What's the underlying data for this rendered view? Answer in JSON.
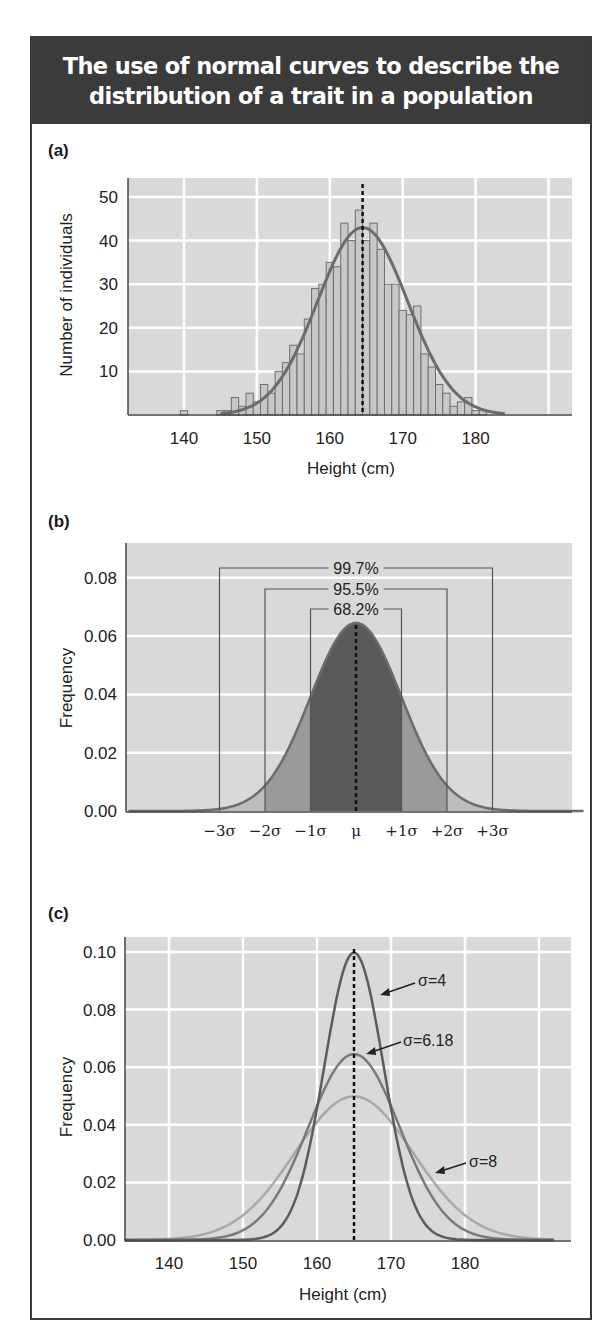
{
  "title": {
    "line1": "The use of normal curves to describe the",
    "line2": "distribution of a trait in a population"
  },
  "colors": {
    "title_bg": "#3b3b3b",
    "plot_bg": "#d9d9d9",
    "grid": "#ffffff",
    "curve": "#6b6b6b",
    "bar_fill": "#c8c8c8",
    "bar_edge": "#6e6e6e",
    "band_1sigma": "#5a5a5a",
    "band_2sigma": "#9a9a9a",
    "band_3sigma": "#bdbdbd",
    "sigma4": "#5c5c5c",
    "sigma618": "#7a7a7a",
    "sigma8": "#a8a8a8"
  },
  "chart_data": [
    {
      "panel": "(a)",
      "type": "bar",
      "title": "",
      "xlabel": "Height (cm)",
      "ylabel": "Number of individuals",
      "xlim": [
        132.5,
        193
      ],
      "ylim": [
        0,
        54
      ],
      "xticks": [
        140,
        150,
        160,
        170,
        180
      ],
      "yticks": [
        10,
        20,
        30,
        40,
        50
      ],
      "grid": true,
      "bin_width_cm": 1,
      "categories": [
        140,
        145,
        146,
        147,
        148,
        149,
        150,
        151,
        152,
        153,
        154,
        155,
        156,
        157,
        158,
        159,
        160,
        161,
        162,
        163,
        164,
        165,
        166,
        167,
        168,
        169,
        170,
        171,
        172,
        173,
        174,
        175,
        176,
        177,
        178,
        179,
        180,
        181
      ],
      "values": [
        1,
        1,
        1,
        4,
        2,
        5,
        3,
        7,
        5,
        10,
        12,
        16,
        14,
        22,
        29,
        30,
        35,
        34,
        44,
        40,
        47,
        40,
        44,
        38,
        30,
        30,
        24,
        23,
        25,
        14,
        11,
        7,
        5,
        2,
        3,
        4,
        1,
        1
      ],
      "fitted_normal": {
        "mean": 164.5,
        "sd": 6.18,
        "peak": 43
      },
      "mean_line": 164.5
    },
    {
      "panel": "(b)",
      "type": "area",
      "title": "",
      "xlabel": "",
      "ylabel": "Frequency",
      "ylim": [
        0,
        0.092
      ],
      "yticks": [
        "0.00",
        "0.02",
        "0.04",
        "0.06",
        "0.08"
      ],
      "grid": true,
      "xtick_labels": [
        "−3σ",
        "−2σ",
        "−1σ",
        "μ",
        "+1σ",
        "+2σ",
        "+3σ"
      ],
      "curve": {
        "mean": 0,
        "sd": 1,
        "peak_frequency": 0.0645
      },
      "annotations": [
        {
          "label": "68.2%",
          "range": [
            "−1σ",
            "+1σ"
          ]
        },
        {
          "label": "95.5%",
          "range": [
            "−2σ",
            "+2σ"
          ]
        },
        {
          "label": "99.7%",
          "range": [
            "−3σ",
            "+3σ"
          ]
        }
      ]
    },
    {
      "panel": "(c)",
      "type": "line",
      "title": "",
      "xlabel": "Height (cm)",
      "ylabel": "Frequency",
      "xlim": [
        134,
        192
      ],
      "ylim": [
        0,
        0.105
      ],
      "xticks": [
        140,
        150,
        160,
        170,
        180
      ],
      "yticks": [
        "0.00",
        "0.02",
        "0.04",
        "0.06",
        "0.08",
        "0.10"
      ],
      "grid": true,
      "mean_line": 165,
      "series": [
        {
          "name": "σ=4",
          "mean": 165,
          "sd": 4,
          "peak": 0.0997
        },
        {
          "name": "σ=6.18",
          "mean": 165,
          "sd": 6.18,
          "peak": 0.0646
        },
        {
          "name": "σ=8",
          "mean": 165,
          "sd": 8,
          "peak": 0.0499
        }
      ]
    }
  ],
  "panels": {
    "a": {
      "label": "(a)",
      "ylabel": "Number of individuals",
      "xlabel": "Height (cm)",
      "xticks": [
        "140",
        "150",
        "160",
        "170",
        "180"
      ],
      "yticks": [
        "10",
        "20",
        "30",
        "40",
        "50"
      ]
    },
    "b": {
      "label": "(b)",
      "ylabel": "Frequency",
      "yticks": [
        "0.00",
        "0.02",
        "0.04",
        "0.06",
        "0.08"
      ],
      "sigma_labels": [
        "−3σ",
        "−2σ",
        "−1σ",
        "μ",
        "+1σ",
        "+2σ",
        "+3σ"
      ],
      "pct_997": "99.7%",
      "pct_955": "95.5%",
      "pct_682": "68.2%"
    },
    "c": {
      "label": "(c)",
      "ylabel": "Frequency",
      "xlabel": "Height (cm)",
      "xticks": [
        "140",
        "150",
        "160",
        "170",
        "180"
      ],
      "yticks": [
        "0.00",
        "0.02",
        "0.04",
        "0.06",
        "0.08",
        "0.10"
      ],
      "ann_sigma4": "σ=4",
      "ann_sigma618": "σ=6.18",
      "ann_sigma8": "σ=8"
    }
  }
}
